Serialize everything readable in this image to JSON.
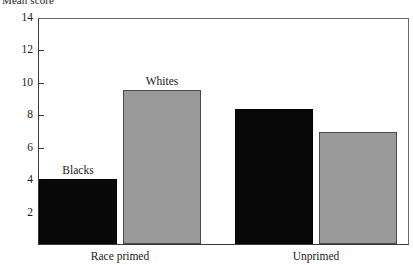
{
  "chart_data": {
    "type": "bar",
    "title": "",
    "ylabel": "Mean score",
    "xlabel": "",
    "ylim": [
      0,
      14
    ],
    "ytick_values": [
      14,
      12,
      10,
      8,
      6,
      4,
      2
    ],
    "ytick_labels": [
      "14",
      "12",
      "10",
      "8",
      "6",
      "4",
      "2"
    ],
    "grid": false,
    "legend": "inline-annotations",
    "categories": [
      "Race primed",
      "Unprimed"
    ],
    "series": [
      {
        "name": "Blacks",
        "color": "#080808",
        "values": [
          4.0,
          8.3
        ]
      },
      {
        "name": "Whites",
        "color": "#9a9a9a",
        "values": [
          9.5,
          6.9
        ]
      }
    ],
    "annotations": [
      {
        "text": "Blacks",
        "series": "Blacks",
        "category": "Race primed",
        "value": 4.0
      },
      {
        "text": "Whites",
        "series": "Whites",
        "category": "Race primed",
        "value": 9.5
      }
    ]
  },
  "axis": {
    "y_title": "Mean score"
  }
}
